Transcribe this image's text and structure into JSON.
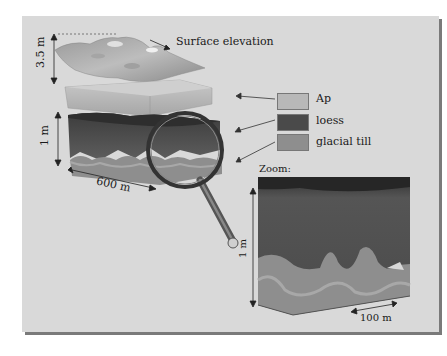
{
  "diagram": {
    "surface_label": "Surface elevation",
    "height_top": "3.5 m",
    "height_layers": "1 m",
    "width_block": "600 m",
    "legend": [
      {
        "label": "Ap",
        "color": "#b8b8b8"
      },
      {
        "label": "loess",
        "color": "#4a4a4a"
      },
      {
        "label": "glacial till",
        "color": "#8e8e8e"
      }
    ],
    "zoom_title": "Zoom:",
    "zoom_height": "1 m",
    "zoom_width": "100 m"
  }
}
